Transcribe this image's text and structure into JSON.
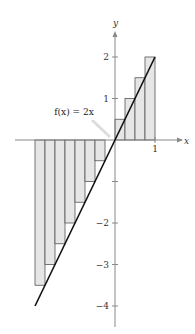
{
  "chart_data": {
    "type": "bar",
    "title": "",
    "function_label": "f(x) = 2x",
    "function": "2x",
    "xlabel": "x",
    "ylabel": "y",
    "xlim": [
      -2,
      1
    ],
    "ylim": [
      -4,
      2
    ],
    "x_ticks": [
      {
        "value": 1,
        "label": "1"
      }
    ],
    "y_ticks": [
      {
        "value": 2,
        "label": "2"
      },
      {
        "value": 1,
        "label": "1"
      },
      {
        "value": -2,
        "label": "−2"
      },
      {
        "value": -3,
        "label": "−3"
      },
      {
        "value": -4,
        "label": "−4"
      }
    ],
    "rectangle_width": 0.25,
    "rectangles": [
      {
        "x0": -2.0,
        "x1": -1.75,
        "height": -3.5
      },
      {
        "x0": -1.75,
        "x1": -1.5,
        "height": -3.0
      },
      {
        "x0": -1.5,
        "x1": -1.25,
        "height": -2.5
      },
      {
        "x0": -1.25,
        "x1": -1.0,
        "height": -2.0
      },
      {
        "x0": -1.0,
        "x1": -0.75,
        "height": -1.5
      },
      {
        "x0": -0.75,
        "x1": -0.5,
        "height": -1.0
      },
      {
        "x0": -0.5,
        "x1": -0.25,
        "height": -0.5
      },
      {
        "x0": -0.25,
        "x1": 0.0,
        "height": 0.0
      },
      {
        "x0": 0.0,
        "x1": 0.25,
        "height": 0.5
      },
      {
        "x0": 0.25,
        "x1": 0.5,
        "height": 1.0
      },
      {
        "x0": 0.5,
        "x1": 0.75,
        "height": 1.5
      },
      {
        "x0": 0.75,
        "x1": 1.0,
        "height": 2.0
      }
    ],
    "line": {
      "x": [
        -2,
        1
      ],
      "y": [
        -4,
        2
      ]
    },
    "grid": false,
    "colors": {
      "fill": "#e6e6e6",
      "stroke": "#555555",
      "line": "#111111",
      "axis": "#888888"
    }
  },
  "labels": {
    "callout": "f(x) = 2x",
    "x_axis": "x",
    "y_axis": "y"
  }
}
